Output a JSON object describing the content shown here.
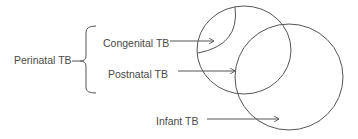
{
  "diagram": {
    "group_label": "Perinatal TB",
    "items": [
      {
        "label": "Congenital TB"
      },
      {
        "label": "Postnatal TB"
      },
      {
        "label": "Infant TB"
      }
    ],
    "colors": {
      "stroke": "#555555",
      "text": "#4a4a4a",
      "background": "#ffffff"
    }
  }
}
